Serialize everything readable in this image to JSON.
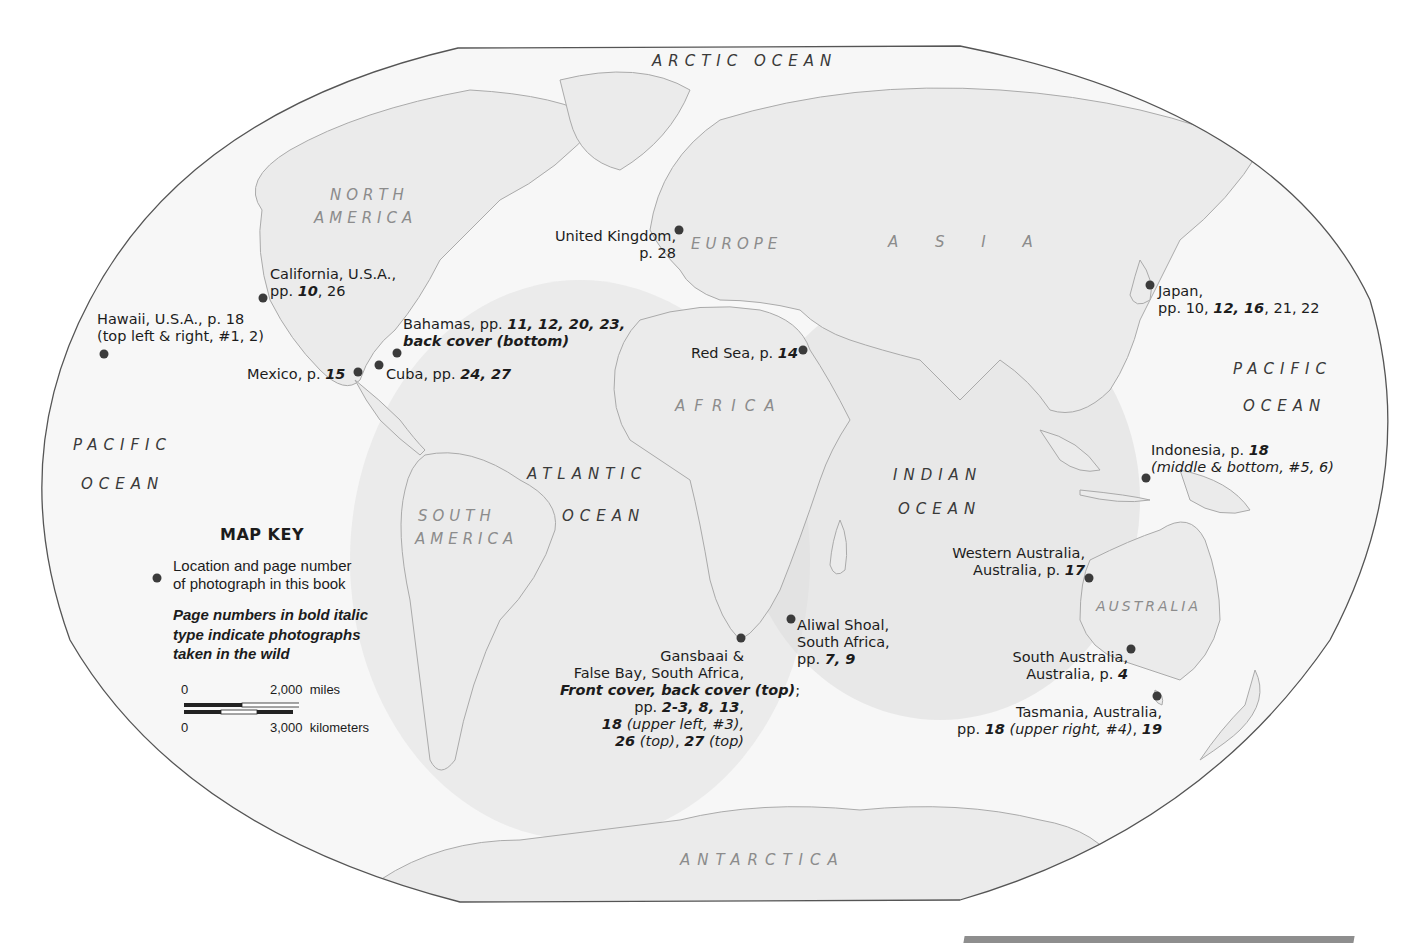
{
  "map": {
    "projection_outline": "winkel-tripel-style ellipse",
    "colors": {
      "land": "#e9e9e9",
      "ocean": "#f6f6f6",
      "ocean_shade": "#dcdcdc",
      "outline": "#555555",
      "dot": "#3b3b3b"
    }
  },
  "oceans": [
    {
      "id": "arctic",
      "label": "ARCTIC OCEAN"
    },
    {
      "id": "pacific-east-1",
      "label": "PACIFIC"
    },
    {
      "id": "pacific-east-2",
      "label": "OCEAN"
    },
    {
      "id": "pacific-west-1",
      "label": "PACIFIC"
    },
    {
      "id": "pacific-west-2",
      "label": "OCEAN"
    },
    {
      "id": "atlantic-1",
      "label": "ATLANTIC"
    },
    {
      "id": "atlantic-2",
      "label": "OCEAN"
    },
    {
      "id": "indian-1",
      "label": "INDIAN"
    },
    {
      "id": "indian-2",
      "label": "OCEAN"
    }
  ],
  "continents": [
    {
      "id": "north-america-1",
      "label": "NORTH"
    },
    {
      "id": "north-america-2",
      "label": "AMERICA"
    },
    {
      "id": "south-america-1",
      "label": "SOUTH"
    },
    {
      "id": "south-america-2",
      "label": "AMERICA"
    },
    {
      "id": "europe",
      "label": "EUROPE"
    },
    {
      "id": "asia",
      "label": "A S I A"
    },
    {
      "id": "africa",
      "label": "AFRICA"
    },
    {
      "id": "australia",
      "label": "AUSTRALIA"
    },
    {
      "id": "antarctica",
      "label": "ANTARCTICA"
    }
  ],
  "locations": [
    {
      "name": "Hawaii",
      "lines": [
        "Hawaii, U.S.A., p. 18",
        "(top left & right, #1, 2)"
      ]
    },
    {
      "name": "California",
      "line1": "California, U.S.A.,",
      "pre": "pp. ",
      "bold": "10",
      "post": ", 26"
    },
    {
      "name": "Mexico",
      "pre": "Mexico, p. ",
      "bold": "15"
    },
    {
      "name": "Cuba",
      "pre": "Cuba, pp. ",
      "bold": "24, 27"
    },
    {
      "name": "Bahamas",
      "pre": "Bahamas, pp. ",
      "bold": "11, 12, 20, 23,",
      "line2": "back cover (bottom)"
    },
    {
      "name": "United Kingdom",
      "lines": [
        "United Kingdom,",
        "p. 28"
      ]
    },
    {
      "name": "Red Sea",
      "pre": "Red Sea, p. ",
      "bold": "14"
    },
    {
      "name": "Japan",
      "line1": "Japan,",
      "pre": "pp. 10, ",
      "bold": "12, 16",
      "post": ", 21, 22"
    },
    {
      "name": "Indonesia",
      "pre": "Indonesia, p. ",
      "bold": "18",
      "line2": "(middle & bottom, #5, 6)"
    },
    {
      "name": "Western Australia",
      "line1": "Western Australia,",
      "pre": "Australia, p. ",
      "bold": "17"
    },
    {
      "name": "South Australia",
      "line1": "South Australia,",
      "pre": "Australia, p. ",
      "bold": "4"
    },
    {
      "name": "Tasmania",
      "line1": "Tasmania, Australia,",
      "pre": "pp. ",
      "bold": "18",
      "italic": " (upper right, #4)",
      "post": ", ",
      "bold2": "19"
    },
    {
      "name": "Aliwal Shoal",
      "lines": [
        "Aliwal Shoal,",
        "South Africa,"
      ],
      "pre": "pp. ",
      "bold": "7, 9"
    },
    {
      "name": "Gansbaai",
      "lines": [
        "Gansbaai &",
        "False Bay, South Africa,"
      ],
      "bold_line": "Front cover, back cover (top)",
      "bold_line_post": ";",
      "pre": "pp. ",
      "bold": "2-3, 8, 13",
      "post": ",",
      "l5_bold": "18",
      "l5_italic": " (upper left, #3),",
      "l6_bold": "26",
      "l6_italic": " (top)",
      "l6_mid": ", ",
      "l6_bold2": "27",
      "l6_italic2": " (top)"
    }
  ],
  "map_key": {
    "title": "MAP KEY",
    "dot_desc_1": "Location and page number",
    "dot_desc_2": "of photograph in this book",
    "bold_desc_1": "Page numbers in bold italic",
    "bold_desc_2": "type indicate photographs",
    "bold_desc_3": "taken in the wild",
    "scale_miles_zero": "0",
    "scale_miles_value": "2,000",
    "scale_miles_unit": "miles",
    "scale_km_zero": "0",
    "scale_km_value": "3,000",
    "scale_km_unit": "kilometers"
  }
}
